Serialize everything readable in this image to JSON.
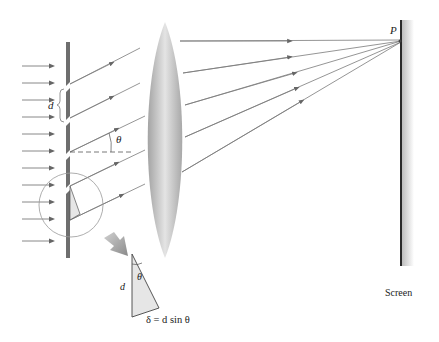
{
  "figure": {
    "type": "diffraction-grating-diagram",
    "labels": {
      "slit_spacing": "d",
      "angle": "θ",
      "point": "P",
      "screen": "Screen",
      "triangle_side": "d",
      "triangle_angle": "θ",
      "path_difference": "δ = d sin θ"
    },
    "colors": {
      "ray": "#7a7a7a",
      "arrowhead": "#666666",
      "grating": "#6e6e6e",
      "lens_edge": "#a8a8a8",
      "lens_center": "#e2e2e2",
      "screen": "#2a2a2a",
      "triangle_fill": "#e6e6e6",
      "text": "#222222"
    },
    "incident_arrow_y": [
      66,
      83,
      100,
      117,
      134,
      151,
      168,
      185,
      202,
      219,
      241
    ],
    "slit_y": [
      56,
      90,
      124,
      158,
      192
    ],
    "focused_rays": [
      {
        "from_y": 56,
        "lens_y": 44,
        "arrow_x": 290
      },
      {
        "from_y": 90,
        "lens_y": 72,
        "arrow_x": 290
      },
      {
        "from_y": 124,
        "lens_y": 102,
        "arrow_x": 295
      },
      {
        "from_y": 158,
        "lens_y": 130,
        "arrow_x": 297
      },
      {
        "from_y": 192,
        "lens_y": 158,
        "arrow_x": 302
      }
    ]
  }
}
